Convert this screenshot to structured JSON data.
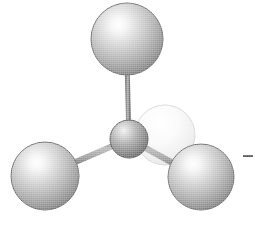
{
  "figure": {
    "title": "Ball-and-stick molecular model",
    "background_color": "#ffffff",
    "width": 255,
    "height": 228
  },
  "palette": {
    "background": "#ffffff",
    "sphere_light": "#f2f2f2",
    "sphere_mid": "#b6b6b6",
    "sphere_dark": "#6e6e6e",
    "sphere_edge": "#5a5a5a",
    "center_light": "#e6e6e6",
    "center_mid": "#a0a0a0",
    "center_dark": "#5c5c5c",
    "ghost_light": "#fbfbfb",
    "ghost_mid": "#e3e3e3",
    "ghost_edge": "#cfcfcf",
    "bond": "#8e8e8e",
    "bond_shadow": "#6a6a6a",
    "mark": "#555555"
  },
  "atoms": [
    {
      "id": "atom-center",
      "label": "central atom",
      "role": "center",
      "cx": 129,
      "cy": 139,
      "r": 19,
      "style": "solid-dark"
    },
    {
      "id": "atom-top",
      "label": "top substituent atom",
      "role": "substituent",
      "cx": 127,
      "cy": 39,
      "r": 36,
      "style": "solid-light"
    },
    {
      "id": "atom-bottom-left",
      "label": "lower-left substituent atom",
      "role": "substituent",
      "cx": 45,
      "cy": 176,
      "r": 34,
      "style": "solid-light"
    },
    {
      "id": "atom-bottom-right",
      "label": "lower-right substituent atom",
      "role": "substituent",
      "cx": 201,
      "cy": 177,
      "r": 33,
      "style": "solid-light"
    },
    {
      "id": "atom-ghost",
      "label": "rear faint substituent atom",
      "role": "substituent-rear",
      "cx": 165,
      "cy": 135,
      "r": 30,
      "style": "faint"
    }
  ],
  "bonds": [
    {
      "id": "bond-center-top",
      "label": "bond to top atom",
      "x1": 129,
      "y1": 139,
      "x2": 127,
      "y2": 62,
      "width": 5
    },
    {
      "id": "bond-center-bottom-left",
      "label": "bond to lower-left atom",
      "x1": 129,
      "y1": 139,
      "x2": 68,
      "y2": 166,
      "width": 6
    },
    {
      "id": "bond-center-bottom-right",
      "label": "bond to lower-right atom",
      "x1": 129,
      "y1": 139,
      "x2": 180,
      "y2": 167,
      "width": 6
    }
  ],
  "marks": [
    {
      "id": "edge-dash",
      "label": "leader dash at right edge",
      "x": 243,
      "y": 156,
      "length": 10,
      "thickness": 2
    }
  ]
}
